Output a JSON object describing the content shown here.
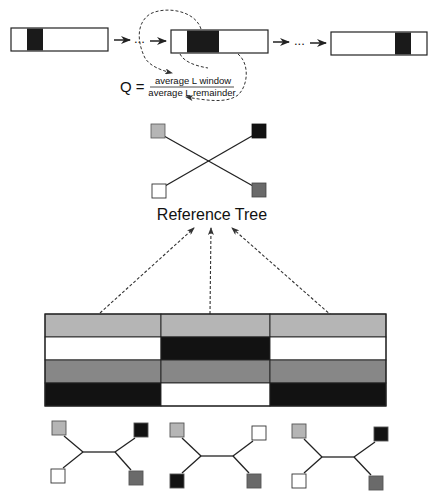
{
  "colors": {
    "light_gray": "#b5b5b5",
    "medium_gray": "#878787",
    "dark_gray": "#6a6a6a",
    "black": "#121212",
    "white": "#ffffff",
    "line": "#222222"
  },
  "sliding_window": {
    "boxes": [
      {
        "x": 11,
        "y": 28,
        "w": 97,
        "h": 23,
        "window_x": 27,
        "window_w": 16
      },
      {
        "x": 171,
        "y": 30,
        "w": 97,
        "h": 23,
        "window_x": 187,
        "window_w": 32
      },
      {
        "x": 331,
        "y": 32,
        "w": 96,
        "h": 23,
        "window_x": 395,
        "window_w": 16
      }
    ],
    "separator": "..."
  },
  "formula": {
    "lhs": "Q =",
    "numerator": "average L window",
    "denominator": "average L remainder"
  },
  "reference_tree": {
    "label": "Reference Tree",
    "leaves": [
      "light_gray",
      "black",
      "white",
      "dark_gray"
    ]
  },
  "alignment": {
    "rows": [
      [
        "light_gray",
        "light_gray",
        "light_gray"
      ],
      [
        "white",
        "black",
        "white"
      ],
      [
        "medium_gray",
        "medium_gray",
        "medium_gray"
      ],
      [
        "black",
        "white",
        "black"
      ]
    ]
  },
  "partition_trees": [
    {
      "top_left": "light_gray",
      "top_right": "black",
      "bottom_left": "white",
      "bottom_right": "dark_gray"
    },
    {
      "top_left": "light_gray",
      "top_right": "white",
      "bottom_left": "black",
      "bottom_right": "dark_gray"
    },
    {
      "top_left": "light_gray",
      "top_right": "black",
      "bottom_left": "white",
      "bottom_right": "dark_gray"
    }
  ]
}
